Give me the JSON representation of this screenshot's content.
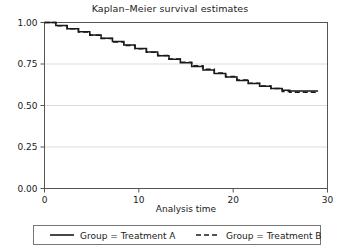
{
  "chart_data": {
    "type": "line",
    "title": "Kaplan–Meier survival estimates",
    "xlabel": "Analysis time",
    "ylabel": "",
    "xlim": [
      0,
      30
    ],
    "ylim": [
      0,
      1
    ],
    "grid": true,
    "grid_axis": "y",
    "legend_position": "bottom",
    "x_ticks": [
      "0",
      "10",
      "20",
      "30"
    ],
    "x_tick_values": [
      0,
      10,
      20,
      30
    ],
    "y_ticks": [
      "0.00",
      "0.25",
      "0.50",
      "0.75",
      "1.00"
    ],
    "y_tick_values": [
      0,
      0.25,
      0.5,
      0.75,
      1
    ],
    "series": [
      {
        "name": "Group = Treatment A",
        "style": "solid",
        "color": "#1a1a1a",
        "points": [
          [
            0,
            1.0
          ],
          [
            1.2,
            0.982
          ],
          [
            2.4,
            0.963
          ],
          [
            3.6,
            0.944
          ],
          [
            4.8,
            0.925
          ],
          [
            6.0,
            0.905
          ],
          [
            7.2,
            0.885
          ],
          [
            8.4,
            0.864
          ],
          [
            9.6,
            0.843
          ],
          [
            10.8,
            0.822
          ],
          [
            12.0,
            0.8
          ],
          [
            13.2,
            0.778
          ],
          [
            14.4,
            0.757
          ],
          [
            15.6,
            0.735
          ],
          [
            16.8,
            0.714
          ],
          [
            18.0,
            0.693
          ],
          [
            19.2,
            0.671
          ],
          [
            20.4,
            0.65
          ],
          [
            21.6,
            0.632
          ],
          [
            22.8,
            0.616
          ],
          [
            24.0,
            0.602
          ],
          [
            25.2,
            0.592
          ],
          [
            26.0,
            0.588
          ],
          [
            27.0,
            0.588
          ],
          [
            28.0,
            0.588
          ],
          [
            29.0,
            0.588
          ]
        ]
      },
      {
        "name": "Group = Treatment B",
        "style": "dashed",
        "color": "#1a1a1a",
        "points": [
          [
            0,
            1.0
          ],
          [
            1.2,
            0.981
          ],
          [
            2.4,
            0.962
          ],
          [
            3.6,
            0.943
          ],
          [
            4.8,
            0.923
          ],
          [
            6.0,
            0.903
          ],
          [
            7.2,
            0.883
          ],
          [
            8.4,
            0.862
          ],
          [
            9.6,
            0.842
          ],
          [
            10.8,
            0.821
          ],
          [
            12.0,
            0.801
          ],
          [
            13.2,
            0.78
          ],
          [
            14.4,
            0.76
          ],
          [
            15.6,
            0.74
          ],
          [
            16.8,
            0.718
          ],
          [
            18.0,
            0.696
          ],
          [
            19.2,
            0.674
          ],
          [
            20.4,
            0.653
          ],
          [
            21.6,
            0.634
          ],
          [
            22.8,
            0.617
          ],
          [
            24.0,
            0.603
          ],
          [
            25.2,
            0.585
          ],
          [
            26.0,
            0.58
          ],
          [
            27.0,
            0.58
          ],
          [
            28.0,
            0.58
          ],
          [
            29.0,
            0.58
          ]
        ]
      }
    ]
  },
  "legend": {
    "items": [
      {
        "label": "Group = Treatment A",
        "style": "solid"
      },
      {
        "label": "Group = Treatment B",
        "style": "dashed"
      }
    ]
  },
  "axes": {
    "x_title": "Analysis time"
  },
  "colors": {
    "line": "#1a1a1a",
    "frame": "#555555",
    "grid": "#dcdcdc",
    "background": "#ffffff"
  }
}
